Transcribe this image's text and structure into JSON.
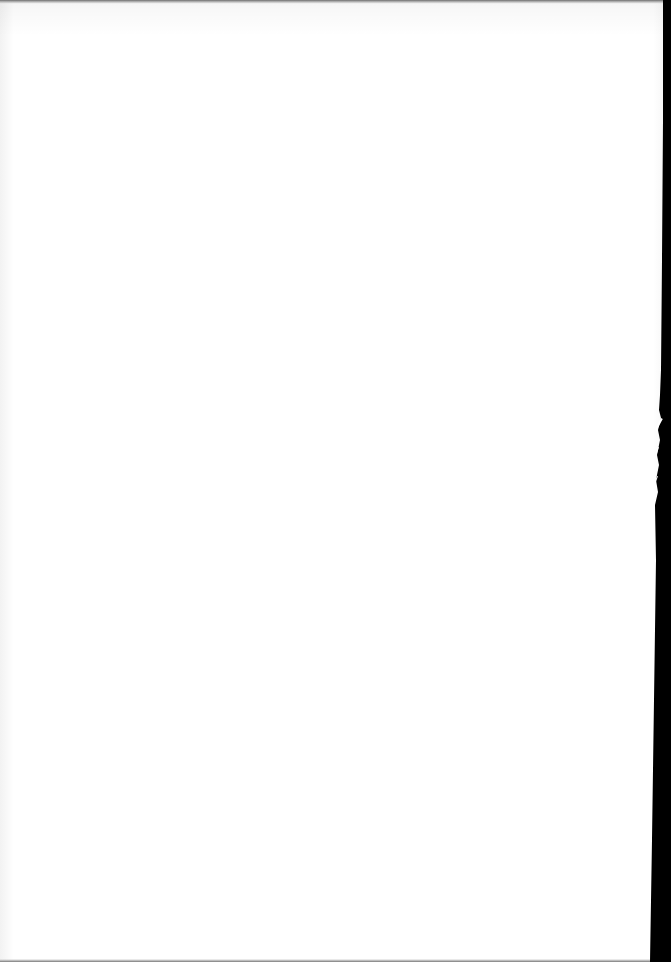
{
  "document": {
    "type": "blank-page-scan",
    "text": "",
    "colors": {
      "paper": "#ffffff",
      "backdrop": "#000000",
      "edge_shadow": "#7a7a7a"
    }
  }
}
